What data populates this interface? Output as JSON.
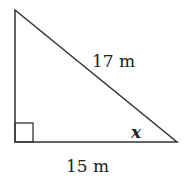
{
  "diagram": {
    "type": "right-triangle",
    "hypotenuse_label": "17 m",
    "base_label": "15 m",
    "angle_label": "x",
    "right_angle_marker": "square",
    "stroke_color": "#333333"
  }
}
